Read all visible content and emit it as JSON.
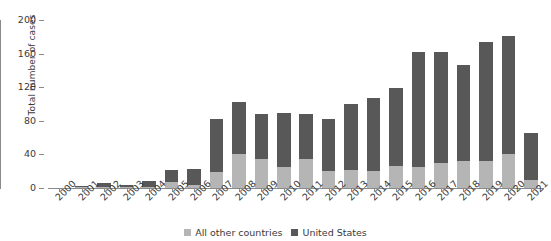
{
  "chart_data": {
    "type": "bar",
    "title": "",
    "subtitle": "",
    "xlabel": "",
    "ylabel": "Total number of cases",
    "stacked": true,
    "grid": false,
    "legend_position": "bottom-center",
    "ylim": [
      0,
      200
    ],
    "yticks": [
      0,
      40,
      80,
      120,
      160,
      200
    ],
    "categories": [
      "2000",
      "2001",
      "2002",
      "2003",
      "2004",
      "2005",
      "2006",
      "2007",
      "2008",
      "2009",
      "2010",
      "2011",
      "2012",
      "2013",
      "2014",
      "2015",
      "2016",
      "2017",
      "2018",
      "2019",
      "2020",
      "2021"
    ],
    "series": [
      {
        "name": "All other countries",
        "color": "#b5b5b5",
        "values": [
          0,
          1,
          1,
          1,
          1,
          7,
          4,
          19,
          40,
          35,
          25,
          34,
          20,
          21,
          20,
          26,
          25,
          30,
          32,
          32,
          40,
          10
        ]
      },
      {
        "name": "United States",
        "color": "#585858",
        "values": [
          0,
          1,
          5,
          3,
          7,
          15,
          19,
          63,
          62,
          53,
          64,
          54,
          62,
          79,
          87,
          93,
          137,
          132,
          114,
          142,
          141,
          55
        ]
      }
    ],
    "totals": [
      0,
      2,
      6,
      4,
      8,
      22,
      23,
      82,
      102,
      88,
      89,
      88,
      82,
      100,
      107,
      119,
      162,
      162,
      146,
      174,
      181,
      65
    ]
  },
  "legend": {
    "items": [
      {
        "label": "All other countries",
        "color": "#b5b5b5"
      },
      {
        "label": "United States",
        "color": "#585858"
      }
    ]
  }
}
